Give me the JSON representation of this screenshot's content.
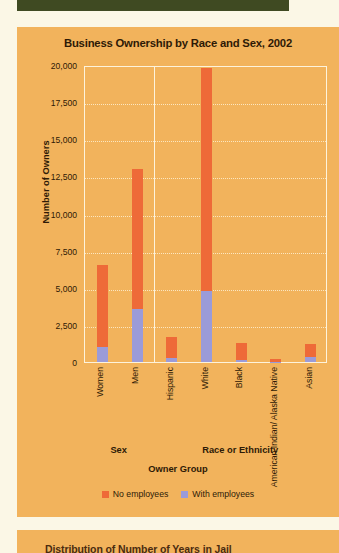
{
  "page": {
    "background_color": "#FBF7E6",
    "panel_color": "#F2B35C",
    "topbar_color": "#3F4A22"
  },
  "next_panel": {
    "partial_caption": "Distribution of Number of Years in Jail"
  },
  "chart_data": {
    "type": "bar",
    "subtype": "stacked-bar",
    "title": "Business Ownership by Race and Sex, 2002",
    "xlabel": "Owner Group",
    "ylabel": "Number of Owners",
    "ylim": [
      0,
      20000
    ],
    "ytick_labels": [
      "20,000",
      "17,500",
      "15,000",
      "12,500",
      "10,000",
      "7,500",
      "5,000",
      "2,500",
      "0"
    ],
    "ytick_values": [
      20000,
      17500,
      15000,
      12500,
      10000,
      7500,
      5000,
      2500,
      0
    ],
    "grid": true,
    "grid_axis": "y",
    "legend_position": "bottom",
    "categories": [
      "Women",
      "Men",
      "Hispanic",
      "White",
      "Black",
      "American Indian/\nAlaska Native",
      "Asian"
    ],
    "groups": [
      {
        "label": "Sex",
        "categories": [
          "Women",
          "Men"
        ]
      },
      {
        "label": "Race or Ethnicity",
        "categories": [
          "Hispanic",
          "White",
          "Black",
          "American Indian/Alaska Native",
          "Asian"
        ]
      }
    ],
    "series": [
      {
        "name": "No employees",
        "color": "#EE6A38",
        "values": [
          5500,
          9400,
          1450,
          15000,
          1150,
          170,
          850
        ]
      },
      {
        "name": "With employees",
        "color": "#9B9BD8",
        "values": [
          1000,
          3600,
          250,
          4800,
          150,
          30,
          350
        ]
      }
    ],
    "totals": [
      6500,
      13000,
      1700,
      19800,
      1300,
      200,
      1200
    ],
    "annotations": []
  }
}
